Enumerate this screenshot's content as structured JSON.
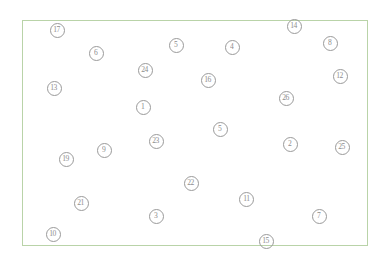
{
  "diagram": {
    "frame": {
      "border_color": "#b9d3a8",
      "background_color": "#ffffff",
      "x": 22,
      "y": 20,
      "width": 346,
      "height": 226
    },
    "marker_style": {
      "shape": "circle",
      "outline_color": "#9a9a9a",
      "label_color": "#8d8d8d",
      "diameter": 15
    },
    "markers": [
      {
        "label": "17",
        "x": 57,
        "y": 30
      },
      {
        "label": "6",
        "x": 96,
        "y": 53
      },
      {
        "label": "5",
        "x": 176,
        "y": 45
      },
      {
        "label": "4",
        "x": 232,
        "y": 47
      },
      {
        "label": "14",
        "x": 294,
        "y": 26
      },
      {
        "label": "8",
        "x": 330,
        "y": 43
      },
      {
        "label": "24",
        "x": 145,
        "y": 70
      },
      {
        "label": "16",
        "x": 208,
        "y": 80
      },
      {
        "label": "12",
        "x": 340,
        "y": 76
      },
      {
        "label": "13",
        "x": 54,
        "y": 88
      },
      {
        "label": "26",
        "x": 286,
        "y": 98
      },
      {
        "label": "1",
        "x": 143,
        "y": 107
      },
      {
        "label": "5",
        "x": 220,
        "y": 129
      },
      {
        "label": "23",
        "x": 156,
        "y": 141
      },
      {
        "label": "2",
        "x": 290,
        "y": 144
      },
      {
        "label": "25",
        "x": 342,
        "y": 147
      },
      {
        "label": "9",
        "x": 104,
        "y": 150
      },
      {
        "label": "19",
        "x": 66,
        "y": 159
      },
      {
        "label": "22",
        "x": 191,
        "y": 183
      },
      {
        "label": "11",
        "x": 246,
        "y": 199
      },
      {
        "label": "21",
        "x": 81,
        "y": 203
      },
      {
        "label": "3",
        "x": 156,
        "y": 216
      },
      {
        "label": "7",
        "x": 319,
        "y": 216
      },
      {
        "label": "10",
        "x": 53,
        "y": 234
      },
      {
        "label": "15",
        "x": 266,
        "y": 241
      }
    ]
  }
}
